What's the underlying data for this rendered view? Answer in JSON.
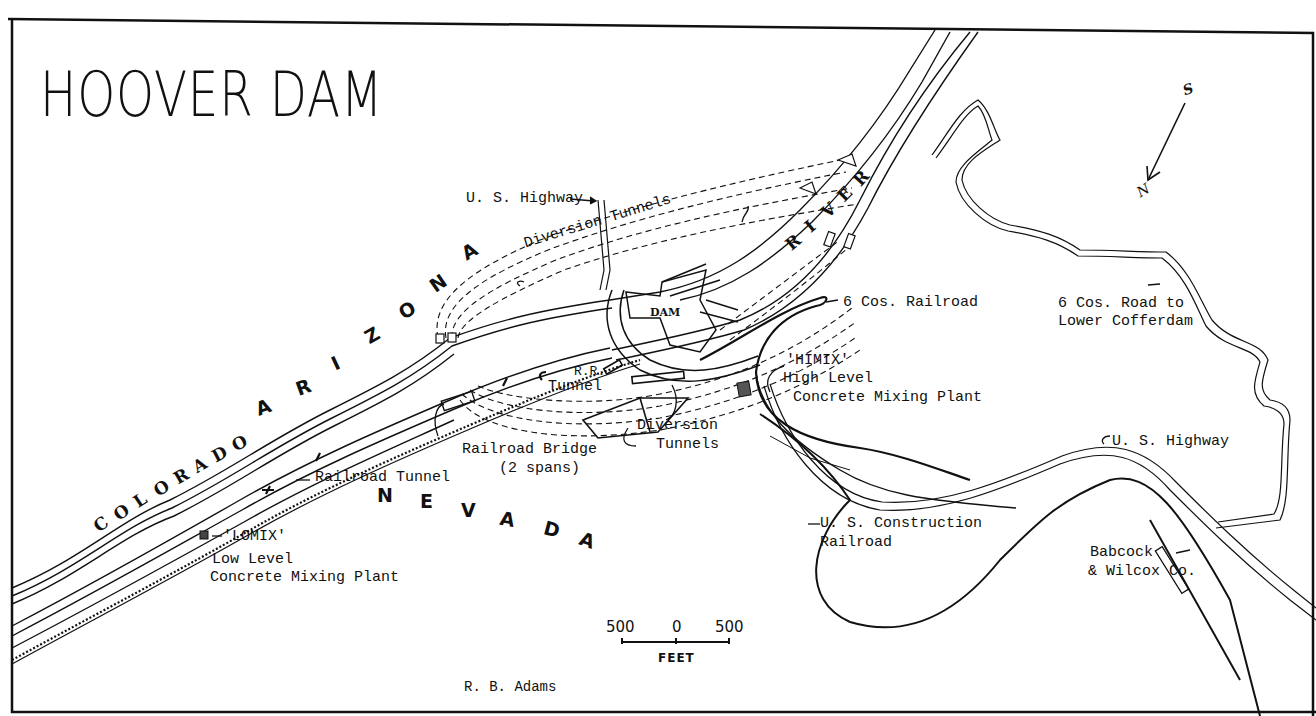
{
  "map": {
    "title": "HOOVER DAM",
    "credit": "R. B. Adams",
    "states": {
      "arizona": [
        "A",
        "R",
        "I",
        "Z",
        "O",
        "N",
        "A"
      ],
      "nevada": [
        "N",
        "E",
        "V",
        "A",
        "D",
        "A"
      ]
    },
    "river": {
      "colorado": [
        "C",
        "O",
        "L",
        "O",
        "R",
        "A",
        "D",
        "O"
      ],
      "river": [
        "R",
        "I",
        "V",
        "E",
        "R"
      ]
    },
    "dam_label": "DAM",
    "labels": {
      "us_highway_top": "U. S. Highway",
      "diversion_tunnels_top": "Diversion Tunnels",
      "six_cos_railroad": "6 Cos. Railroad",
      "six_cos_road_line1": "6 Cos. Road to",
      "six_cos_road_line2": "Lower Cofferdam",
      "himix_line1": "'HIMIX'",
      "himix_line2": "High Level",
      "himix_line3": "Concrete Mixing Plant",
      "rr_tunnel_line1": "R.R.",
      "rr_tunnel_line2": "Tunnel",
      "railroad_bridge_line1": "Railroad Bridge",
      "railroad_bridge_line2": "(2 spans)",
      "diversion_tunnels_bottom_line1": "Diversion",
      "diversion_tunnels_bottom_line2": "Tunnels",
      "railroad_tunnel": "Railroad Tunnel",
      "lomix_line1": "'LOMIX'",
      "lomix_line2": "Low Level",
      "lomix_line3": "Concrete Mixing Plant",
      "us_highway_right": "U. S. Highway",
      "us_construction_line1": "U. S. Construction",
      "us_construction_line2": "Railroad",
      "babcock_line1": "Babcock",
      "babcock_line2": "& Wilcox Co."
    },
    "compass": {
      "top": "S",
      "bottom": "N"
    },
    "scale": {
      "left": "500",
      "center": "0",
      "right": "500",
      "unit": "FEET"
    }
  }
}
